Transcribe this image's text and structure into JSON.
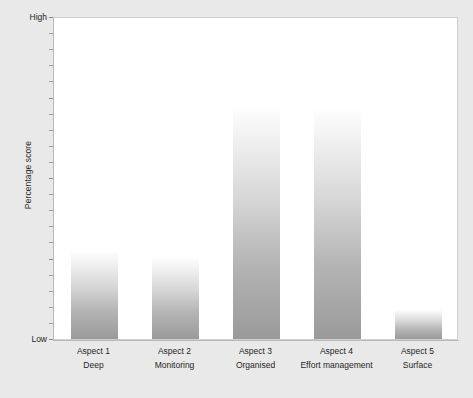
{
  "chart_data": {
    "type": "bar",
    "title": "",
    "subtitle": "",
    "xlabel": "",
    "ylabel": "Percentage score",
    "ylim": [
      0,
      100
    ],
    "ytick_labels": [
      "Low",
      "High"
    ],
    "grid": false,
    "legend": null,
    "categories": [
      "Aspect 1",
      "Aspect 2",
      "Aspect 3",
      "Aspect 4",
      "Aspect 5"
    ],
    "category_descriptions": [
      "Deep",
      "Monitoring",
      "Organised",
      "Effort management",
      "Surface"
    ],
    "values": [
      27,
      25,
      71.5,
      71,
      9
    ],
    "series": [
      {
        "name": "Percentage score",
        "values": [
          27,
          25,
          71.5,
          71,
          9
        ]
      }
    ],
    "bar_gradient_top": "#fdfdfd",
    "bar_gradient_bottom": "#9a9a9a",
    "plot_background": "#ffffff",
    "figure_background": "#e9e9e9",
    "axis_color": "#b9b9b9",
    "tick_count": 21
  },
  "axis": {
    "y_title": "Percentage score",
    "y_high_label": "High",
    "y_low_label": "Low"
  }
}
